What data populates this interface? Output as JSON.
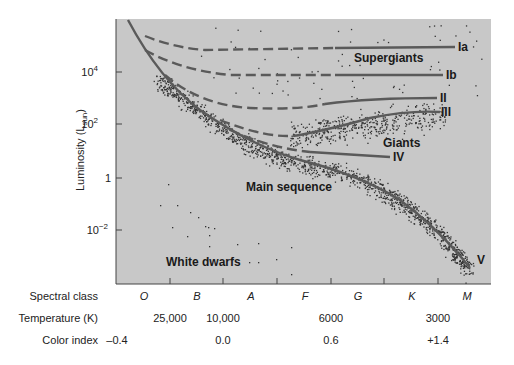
{
  "chart_data": {
    "type": "scatter",
    "xlabel": "Spectral class",
    "ylabel": "Luminosity (L_sun)",
    "yscale": "log",
    "ylim": [
      0.0001,
      1000000
    ],
    "y_ticks": [
      {
        "label": "10^4",
        "value": 10000
      },
      {
        "label": "10^2",
        "value": 100
      },
      {
        "label": "1",
        "value": 1
      },
      {
        "label": "10^-2",
        "value": 0.01
      }
    ],
    "x_axis_rows": [
      {
        "name": "Spectral class",
        "labels": [
          "O",
          "B",
          "A",
          "F",
          "G",
          "K",
          "M"
        ]
      },
      {
        "name": "Temperature (K)",
        "labels": [
          "25,000",
          "10,000",
          "6000",
          "3000"
        ]
      },
      {
        "name": "Color index",
        "labels": [
          "-0.4",
          "0.0",
          "0.6",
          "+1.4"
        ]
      }
    ],
    "luminosity_classes": [
      {
        "label": "Ia",
        "name": "Supergiants Ia",
        "approx_luminosity": 30000
      },
      {
        "label": "Ib",
        "name": "Supergiants Ib",
        "approx_luminosity": 5000
      },
      {
        "label": "II",
        "name": "Bright giants",
        "approx_luminosity": 1000
      },
      {
        "label": "III",
        "name": "Giants",
        "approx_luminosity": 300
      },
      {
        "label": "IV",
        "name": "Subgiants",
        "approx_luminosity": 10
      },
      {
        "label": "V",
        "name": "Main sequence",
        "approx_luminosity_range": [
          0.0001,
          1000000
        ]
      }
    ],
    "regions": [
      "Supergiants",
      "Giants",
      "Main sequence",
      "White dwarfs"
    ],
    "grid": false,
    "background": "#c9c9c9"
  },
  "labels": {
    "ylabel_main": "Luminosity (L",
    "ylabel_sub": "sun",
    "ylabel_close": ")",
    "yticks": {
      "t4": "10",
      "t4e": "4",
      "t2": "10",
      "t2e": "2",
      "t0": "1",
      "tm2": "10",
      "tm2e": "−2"
    },
    "regions": {
      "supergiants": "Supergiants",
      "giants": "Giants",
      "main": "Main sequence",
      "wd": "White dwarfs"
    },
    "classes": {
      "ia": "Ia",
      "ib": "Ib",
      "ii": "II",
      "iii": "III",
      "iv": "IV",
      "v": "V"
    },
    "rows": {
      "spectral": "Spectral class",
      "temp": "Temperature (K)",
      "color": "Color index"
    },
    "spectral": [
      "O",
      "B",
      "A",
      "F",
      "G",
      "K",
      "M"
    ],
    "temps": [
      "25,000",
      "10,000",
      "6000",
      "3000"
    ],
    "colors": [
      "–0.4",
      "0.0",
      "0.6",
      "+1.4"
    ]
  }
}
